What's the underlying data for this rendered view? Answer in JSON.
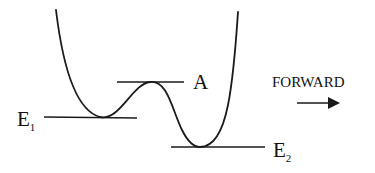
{
  "diagram": {
    "type": "potential-energy-curve",
    "labels": {
      "e1": {
        "main": "E",
        "sub": "1"
      },
      "e2": {
        "main": "E",
        "sub": "2"
      },
      "barrier": "A",
      "direction": "FORWARD"
    },
    "levels": [
      {
        "name": "E1",
        "meaning": "energy of first (higher) minimum"
      },
      {
        "name": "A",
        "meaning": "activation barrier top"
      },
      {
        "name": "E2",
        "meaning": "energy of second (lower) minimum"
      }
    ],
    "arrow": {
      "direction": "right"
    },
    "colors": {
      "stroke": "#1a1a1a",
      "text": "#111111",
      "background": "#ffffff"
    }
  }
}
